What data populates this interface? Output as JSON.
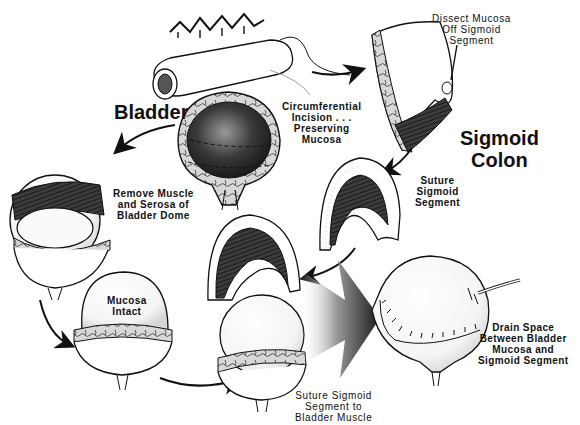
{
  "diagram": {
    "colors": {
      "ink": "#111111",
      "background": "#ffffff",
      "shade_dark": "#2a2a2a",
      "shade_mid": "#7a7a7a",
      "shade_light": "#d9d9d9"
    },
    "labels": {
      "bladder": "Bladder",
      "sigmoid_colon": [
        "Sigmoid",
        "Colon"
      ],
      "dissect_mucosa": [
        "Dissect Mucosa",
        "Off Sigmoid",
        "Segment"
      ],
      "circumferential_incision": [
        "Circumferential",
        "Incision . . .",
        "Preserving",
        "Mucosa"
      ],
      "remove_muscle": [
        "Remove Muscle",
        "and Serosa of",
        "Bladder Dome"
      ],
      "suture_sigmoid_segment": [
        "Suture",
        "Sigmoid",
        "Segment"
      ],
      "mucosa_intact": [
        "Mucosa",
        "Intact"
      ],
      "suture_to_bladder_muscle": [
        "Suture Sigmoid",
        "Segment to",
        "Bladder Muscle"
      ],
      "drain_space": [
        "Drain Space",
        "Between Bladder",
        "Mucosa and",
        "Sigmoid Segment"
      ]
    },
    "nodes": [
      {
        "id": "colon-segment",
        "description": "Sigmoid colon loop with mesentery"
      },
      {
        "id": "opened-sigmoid",
        "description": "Opened sigmoid segment, mucosa being dissected"
      },
      {
        "id": "bladder-section",
        "description": "Bladder cross-section with dashed incision line"
      },
      {
        "id": "bladder-dome-removed",
        "description": "Bladder with muscle and serosa lifted off dome"
      },
      {
        "id": "sutured-sigmoid-cap",
        "description": "Sigmoid segment sutured into cap shape"
      },
      {
        "id": "mucosa-intact-bladder",
        "description": "Bladder with intact mucosa bulging"
      },
      {
        "id": "cap-onto-bladder",
        "description": "Sigmoid cap placed over bladder mucosa"
      },
      {
        "id": "final-bladder",
        "description": "Completed augmentation with suture line and drain"
      }
    ],
    "edges": [
      {
        "from": "colon-segment",
        "to": "opened-sigmoid"
      },
      {
        "from": "opened-sigmoid",
        "to": "sutured-sigmoid-cap"
      },
      {
        "from": "bladder-section",
        "to": "bladder-dome-removed"
      },
      {
        "from": "bladder-dome-removed",
        "to": "mucosa-intact-bladder"
      },
      {
        "from": "mucosa-intact-bladder",
        "to": "cap-onto-bladder"
      },
      {
        "from": "sutured-sigmoid-cap",
        "to": "cap-onto-bladder"
      },
      {
        "from": "cap-onto-bladder",
        "to": "final-bladder"
      }
    ]
  }
}
